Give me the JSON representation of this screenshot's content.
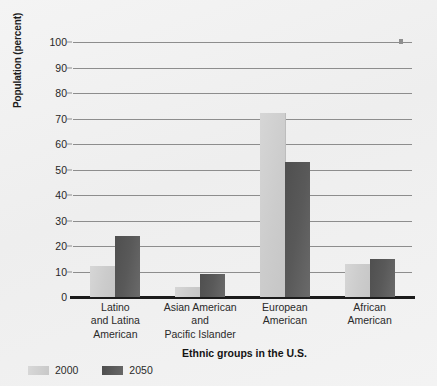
{
  "chart_data": {
    "type": "bar",
    "title": "",
    "xlabel": "Ethnic groups in the U.S.",
    "ylabel": "Population (percent)",
    "ylim": [
      0,
      100
    ],
    "yticks": [
      0,
      10,
      20,
      30,
      40,
      50,
      60,
      70,
      80,
      90,
      100
    ],
    "grid": true,
    "legend_position": "bottom-left",
    "categories": [
      "Latino and Latina American",
      "Asian American and Pacific Islander",
      "European American",
      "African American"
    ],
    "category_lines": [
      [
        "Latino",
        "and Latina",
        "American"
      ],
      [
        "Asian American",
        "and",
        "Pacific Islander"
      ],
      [
        "European",
        "American"
      ],
      [
        "African",
        "American"
      ]
    ],
    "series": [
      {
        "name": "2000",
        "color": "#cfcfcf",
        "values": [
          12,
          4,
          72,
          13
        ]
      },
      {
        "name": "2050",
        "color": "#585858",
        "values": [
          24,
          9,
          53,
          15
        ]
      }
    ]
  },
  "legend": {
    "items": [
      {
        "label": "2000",
        "swatch": "legend-swatch-2000"
      },
      {
        "label": "2050",
        "swatch": "legend-swatch-2050"
      }
    ]
  }
}
